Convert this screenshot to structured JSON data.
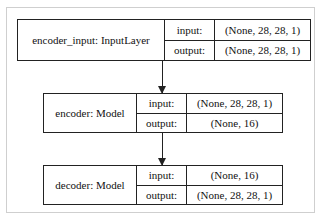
{
  "diagram": {
    "type": "keras-model-plot",
    "nodes": [
      {
        "name": "encoder_input: InputLayer",
        "ports": {
          "input_label": "input:",
          "output_label": "output:"
        },
        "input_shape": "(None, 28, 28, 1)",
        "output_shape": "(None, 28, 28, 1)"
      },
      {
        "name": "encoder: Model",
        "ports": {
          "input_label": "input:",
          "output_label": "output:"
        },
        "input_shape": "(None, 28, 28, 1)",
        "output_shape": "(None, 16)"
      },
      {
        "name": "decoder: Model",
        "ports": {
          "input_label": "input:",
          "output_label": "output:"
        },
        "input_shape": "(None, 16)",
        "output_shape": "(None, 28, 28, 1)"
      }
    ],
    "edges": [
      {
        "from": "encoder_input: InputLayer",
        "to": "encoder: Model"
      },
      {
        "from": "encoder: Model",
        "to": "decoder: Model"
      }
    ]
  }
}
